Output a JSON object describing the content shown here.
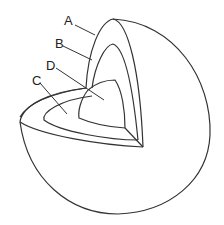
{
  "diagram": {
    "type": "cutaway-sphere-layers",
    "labels": {
      "A": "A",
      "B": "B",
      "C": "C",
      "D": "D"
    }
  }
}
